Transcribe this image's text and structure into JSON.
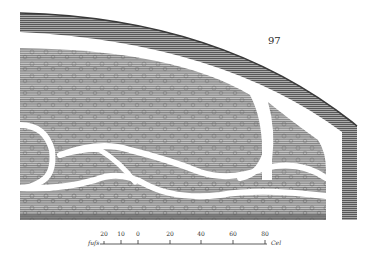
{
  "plate": {
    "page_number": "97",
    "colors": {
      "paper": "#ffffff",
      "ink": "#3a3a3a",
      "hatch_fill": "#a8a8a8",
      "dark_edge": "#5a5a5a"
    },
    "regions": [
      {
        "name": "outer-membrane-band"
      },
      {
        "name": "inner-tissue-mass"
      },
      {
        "name": "lower-tissue-layer"
      },
      {
        "name": "vessel-channels"
      }
    ]
  },
  "scale_bar": {
    "left_label": "fuſs",
    "right_label": "Cel",
    "ticks": [
      {
        "label": "20",
        "x": 104
      },
      {
        "label": "10",
        "x": 121
      },
      {
        "label": "0",
        "x": 138
      },
      {
        "label": "20",
        "x": 170
      },
      {
        "label": "40",
        "x": 201
      },
      {
        "label": "60",
        "x": 233
      },
      {
        "label": "80",
        "x": 265
      }
    ]
  }
}
